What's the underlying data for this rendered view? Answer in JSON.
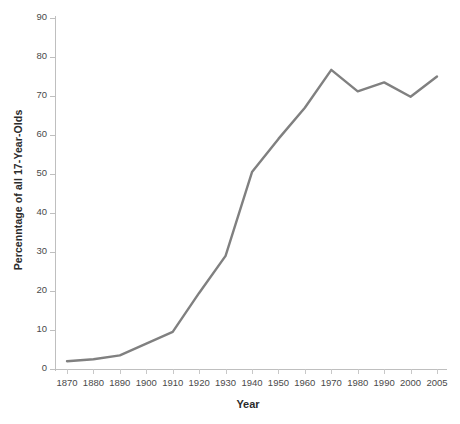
{
  "chart_data": {
    "type": "line",
    "title": "",
    "xlabel": "Year",
    "ylabel": "Percenntage of all 17-Year-Olds",
    "x": [
      1870,
      1880,
      1890,
      1900,
      1910,
      1920,
      1930,
      1940,
      1950,
      1960,
      1970,
      1980,
      1990,
      2000,
      2005
    ],
    "xtick_labels": [
      "1870",
      "1880",
      "1890",
      "1900",
      "1910",
      "1920",
      "1930",
      "1940",
      "1950",
      "1960",
      "1970",
      "1980",
      "1990",
      "2000",
      "2005"
    ],
    "values": [
      2,
      2.5,
      3.5,
      6.5,
      9.5,
      19.5,
      29,
      50.5,
      59,
      67,
      76.7,
      71.2,
      73.5,
      69.8,
      75
    ],
    "series": [
      {
        "name": "Percentage of all 17-Year-Olds",
        "color": "#808080",
        "values": [
          2,
          2.5,
          3.5,
          6.5,
          9.5,
          19.5,
          29,
          50.5,
          59,
          67,
          76.7,
          71.2,
          73.5,
          69.8,
          75
        ]
      }
    ],
    "ylim": [
      0,
      90
    ],
    "ytick_labels": [
      "0",
      "10",
      "20",
      "30",
      "40",
      "50",
      "60",
      "70",
      "80",
      "90"
    ],
    "yticks": [
      0,
      10,
      20,
      30,
      40,
      50,
      60,
      70,
      80,
      90
    ],
    "grid": false,
    "legend": "none",
    "markers": false,
    "line_color": "#808080",
    "line_width": 2.4,
    "axis_color": "#bfbfbf",
    "tick_label_color": "#4a4a4a",
    "title_color": "#2b2b2b",
    "background": "#ffffff"
  }
}
